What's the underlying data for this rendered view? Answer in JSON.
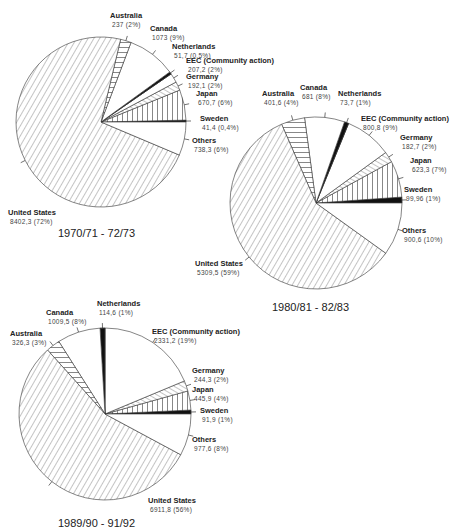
{
  "chart_data": [
    {
      "type": "pie",
      "title": "1970/71 - 72/73",
      "slices": [
        {
          "label": "Sweden",
          "value": 41.4,
          "value_text": "41,4",
          "percent_text": "(0,4%)",
          "pattern": "solid"
        },
        {
          "label": "Japan",
          "value": 670.7,
          "value_text": "670,7",
          "percent_text": "(6%)",
          "pattern": "vertical"
        },
        {
          "label": "Germany",
          "value": 192.1,
          "value_text": "192,1",
          "percent_text": "(2%)",
          "pattern": "diagonal-up"
        },
        {
          "label": "EEC (Community action)",
          "value": 207.2,
          "value_text": "207,2",
          "percent_text": "(2%)",
          "pattern": "blank"
        },
        {
          "label": "Netherlands",
          "value": 51.7,
          "value_text": "51,7",
          "percent_text": "(0,5%)",
          "pattern": "solid"
        },
        {
          "label": "Canada",
          "value": 1073,
          "value_text": "1073",
          "percent_text": "(9%)",
          "pattern": "blank"
        },
        {
          "label": "Australia",
          "value": 237,
          "value_text": "237",
          "percent_text": "(2%)",
          "pattern": "horizontal"
        },
        {
          "label": "United States",
          "value": 8402.3,
          "value_text": "8402,3",
          "percent_text": "(72%)",
          "pattern": "diagonal"
        },
        {
          "label": "Others",
          "value": 738.3,
          "value_text": "738,3",
          "percent_text": "(6%)",
          "pattern": "blank"
        }
      ]
    },
    {
      "type": "pie",
      "title": "1980/81 - 82/83",
      "slices": [
        {
          "label": "Sweden",
          "value": 99.96,
          "value_text": "99,96",
          "percent_text": "(1%)",
          "pattern": "solid"
        },
        {
          "label": "Japan",
          "value": 623.3,
          "value_text": "623,3",
          "percent_text": "(7%)",
          "pattern": "vertical"
        },
        {
          "label": "Germany",
          "value": 182.7,
          "value_text": "182,7",
          "percent_text": "(2%)",
          "pattern": "diagonal-up"
        },
        {
          "label": "EEC (Community action)",
          "value": 800.8,
          "value_text": "800,8",
          "percent_text": "(9%)",
          "pattern": "blank"
        },
        {
          "label": "Netherlands",
          "value": 73.7,
          "value_text": "73,7",
          "percent_text": "(1%)",
          "pattern": "solid"
        },
        {
          "label": "Canada",
          "value": 681,
          "value_text": "681",
          "percent_text": "(8%)",
          "pattern": "blank"
        },
        {
          "label": "Australia",
          "value": 401.6,
          "value_text": "401,6",
          "percent_text": "(4%)",
          "pattern": "horizontal"
        },
        {
          "label": "United States",
          "value": 5309.5,
          "value_text": "5309,5",
          "percent_text": "(59%)",
          "pattern": "diagonal"
        },
        {
          "label": "Others",
          "value": 900.6,
          "value_text": "900,6",
          "percent_text": "(10%)",
          "pattern": "blank"
        }
      ]
    },
    {
      "type": "pie",
      "title": "1989/90 - 91/92",
      "slices": [
        {
          "label": "Sweden",
          "value": 91.9,
          "value_text": "91,9",
          "percent_text": "(1%)",
          "pattern": "solid"
        },
        {
          "label": "Japan",
          "value": 445.9,
          "value_text": "445,9",
          "percent_text": "(4%)",
          "pattern": "vertical"
        },
        {
          "label": "Germany",
          "value": 244.3,
          "value_text": "244,3",
          "percent_text": "(2%)",
          "pattern": "diagonal-up"
        },
        {
          "label": "EEC (Community action)",
          "value": 2331.2,
          "value_text": "2331,2",
          "percent_text": "(19%)",
          "pattern": "blank"
        },
        {
          "label": "Netherlands",
          "value": 114.6,
          "value_text": "114,6",
          "percent_text": "(1%)",
          "pattern": "solid"
        },
        {
          "label": "Canada",
          "value": 1009.5,
          "value_text": "1009,5",
          "percent_text": "(8%)",
          "pattern": "blank"
        },
        {
          "label": "Australia",
          "value": 326.3,
          "value_text": "326,3",
          "percent_text": "(3%)",
          "pattern": "horizontal"
        },
        {
          "label": "United States",
          "value": 6911.8,
          "value_text": "6911,8",
          "percent_text": "(56%)",
          "pattern": "diagonal"
        },
        {
          "label": "Others",
          "value": 977.6,
          "value_text": "977,6",
          "percent_text": "(8%)",
          "pattern": "blank"
        }
      ]
    }
  ]
}
